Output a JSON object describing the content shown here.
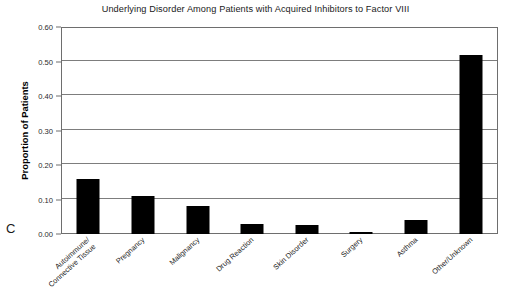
{
  "panel_label": "C",
  "chart_data": {
    "type": "bar",
    "title": "Underlying Disorder Among Patients with Acquired Inhibitors to Factor VIII",
    "xlabel": "",
    "ylabel": "Proportion of Patients",
    "ylim": [
      0.0,
      0.6
    ],
    "grid": true,
    "legend": "none",
    "orientation": "vertical",
    "bar_color": "#000000",
    "categories": [
      "Autoimmune/ Connective Tissue",
      "Pregnancy",
      "Malignancy",
      "Drug Reaction",
      "Skin Disorder",
      "Surgery",
      "Asthma",
      "Other/Unknown"
    ],
    "category_lines": [
      [
        "Autoimmune/",
        "Connective Tissue"
      ],
      [
        "Pregnancy"
      ],
      [
        "Malignancy"
      ],
      [
        "Drug Reaction"
      ],
      [
        "Skin Disorder"
      ],
      [
        "Surgery"
      ],
      [
        "Asthma"
      ],
      [
        "Other/Unknown"
      ]
    ],
    "values": [
      0.16,
      0.11,
      0.08,
      0.03,
      0.025,
      0.005,
      0.04,
      0.52
    ],
    "ytick_labels": [
      "0.60",
      "0.50",
      "0.40",
      "0.30",
      "0.20",
      "0.10",
      "0.00"
    ],
    "ytick_values": [
      0.6,
      0.5,
      0.4,
      0.3,
      0.2,
      0.1,
      0.0
    ]
  }
}
